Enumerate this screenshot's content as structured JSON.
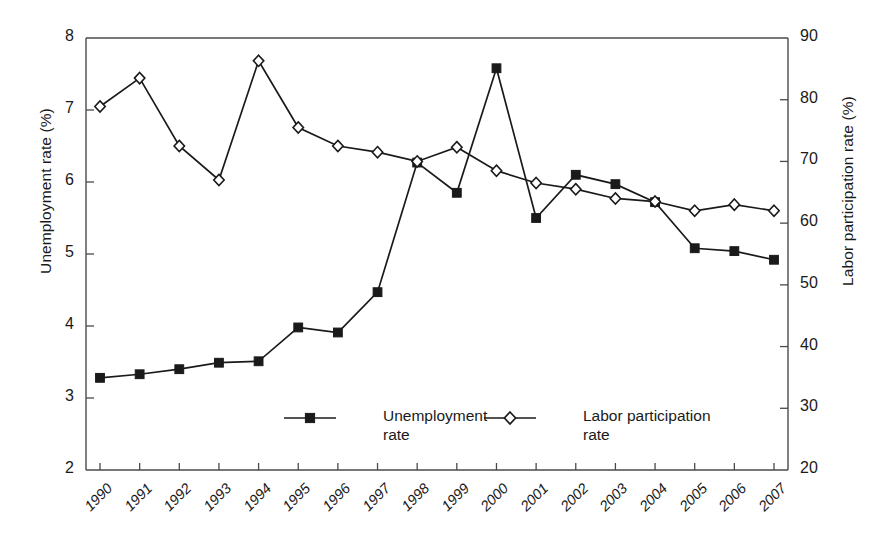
{
  "axes": {
    "left_title": "Unemployment rate (%)",
    "right_title": "Labor participation rate (%)",
    "left_ticks": [
      "8",
      "7",
      "6",
      "5",
      "4",
      "3",
      "2"
    ],
    "right_ticks": [
      "90",
      "80",
      "70",
      "60",
      "50",
      "40",
      "30",
      "20"
    ],
    "x_ticks": [
      "1990",
      "1991",
      "1992",
      "1993",
      "1994",
      "1995",
      "1996",
      "1997",
      "1998",
      "1999",
      "2000",
      "2001",
      "2002",
      "2003",
      "2004",
      "2005",
      "2006",
      "2007"
    ]
  },
  "legend": {
    "entries": [
      {
        "label_line1": "Unemployment",
        "label_line2": "rate",
        "marker": "filled-square-marker"
      },
      {
        "label_line1": "Labor participation",
        "label_line2": "rate",
        "marker": "open-diamond-marker"
      }
    ]
  },
  "style": {
    "line_color": "#1a1a1a",
    "axis_color": "#4a4a4a",
    "background": "#ffffff"
  },
  "chart_data": {
    "type": "line",
    "title": "",
    "xlabel": "",
    "grid": false,
    "legend_position": "inside-bottom-center",
    "x": [
      "1990",
      "1991",
      "1992",
      "1993",
      "1994",
      "1995",
      "1996",
      "1997",
      "1998",
      "1999",
      "2000",
      "2001",
      "2002",
      "2003",
      "2004",
      "2005",
      "2006",
      "2007"
    ],
    "series": [
      {
        "name": "Unemployment rate",
        "axis": "left",
        "ylabel": "Unemployment rate (%)",
        "ylim": [
          2,
          8
        ],
        "ytick_step": 1,
        "marker": "filled-square",
        "values": [
          3.28,
          3.33,
          3.4,
          3.49,
          3.51,
          3.98,
          3.91,
          4.47,
          6.27,
          5.85,
          7.58,
          5.5,
          6.1,
          5.97,
          5.72,
          5.08,
          5.04,
          4.92
        ]
      },
      {
        "name": "Labor participation rate",
        "axis": "right",
        "ylabel": "Labor participation rate (%)",
        "ylim": [
          20,
          90
        ],
        "ytick_step": 10,
        "marker": "open-diamond",
        "values": [
          78.9,
          83.5,
          72.5,
          67.0,
          86.3,
          75.5,
          72.5,
          71.5,
          70.0,
          72.3,
          68.5,
          66.5,
          65.5,
          64.0,
          63.5,
          62.0,
          63.0,
          62.0
        ]
      }
    ]
  }
}
